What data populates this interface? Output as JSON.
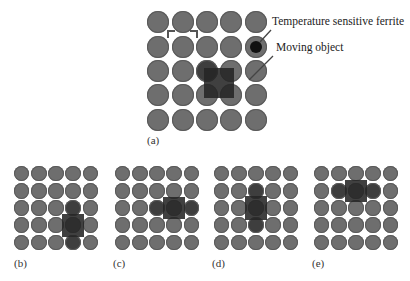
{
  "figure": {
    "annotations": {
      "ferrite_label": "Temperature sensitive ferrite",
      "object_label": "Moving object"
    },
    "panels": [
      {
        "id": "a",
        "label": "(a)",
        "object": {
          "col": 2.5,
          "row": 2.5,
          "w": 1.25,
          "h": 1.25
        },
        "dark_cells": [
          [
            2,
            2
          ]
        ],
        "ferrite_cell": [
          1,
          4
        ]
      },
      {
        "id": "b",
        "label": "(b)",
        "object": {
          "col": 3,
          "row": 3,
          "w": 1.25,
          "h": 1.35
        },
        "dark_cells": [
          [
            2,
            3
          ],
          [
            4,
            3
          ]
        ]
      },
      {
        "id": "c",
        "label": "(c)",
        "object": {
          "col": 3,
          "row": 2,
          "w": 1.25,
          "h": 1.25
        },
        "dark_cells": [
          [
            2,
            2
          ],
          [
            2,
            4
          ]
        ]
      },
      {
        "id": "d",
        "label": "(d)",
        "object": {
          "col": 2,
          "row": 2,
          "w": 1.25,
          "h": 1.35
        },
        "dark_cells": [
          [
            1,
            2
          ],
          [
            3,
            2
          ]
        ]
      },
      {
        "id": "e",
        "label": "(e)",
        "object": {
          "col": 2,
          "row": 1,
          "w": 1.25,
          "h": 1.25
        },
        "dark_cells": [
          [
            1,
            1
          ],
          [
            1,
            3
          ]
        ]
      }
    ],
    "colors": {
      "ferrite_cell": "#6e6e6e",
      "activated_cell": "#3e3e3e",
      "moving_object": "#262626",
      "background": "#ffffff"
    }
  }
}
